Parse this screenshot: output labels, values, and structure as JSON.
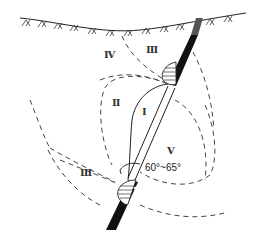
{
  "diagram": {
    "type": "geological-section",
    "colors": {
      "line": "#222222",
      "dashed": "#444444",
      "ore_body": "#111111",
      "ore_body_upper": "#555555",
      "background": "#ffffff"
    },
    "zones": [
      {
        "id": "IV",
        "label": "Ⅳ"
      },
      {
        "id": "III-upper",
        "label": "Ⅲ"
      },
      {
        "id": "II",
        "label": "Ⅱ"
      },
      {
        "id": "I",
        "label": "Ⅰ"
      },
      {
        "id": "V",
        "label": "Ⅴ"
      },
      {
        "id": "III-lower",
        "label": "Ⅲ"
      }
    ],
    "angle_annotation": "60°~65°",
    "ground_surface": "hatched ground surface line"
  }
}
